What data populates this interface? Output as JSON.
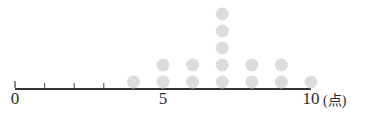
{
  "chart_data": {
    "type": "scatter",
    "plot_kind": "dot-plot",
    "title": "",
    "subtitle": "",
    "xlabel": "(点)",
    "ylabel": "",
    "xlim": [
      0,
      10
    ],
    "grid": false,
    "legend": null,
    "axis_labels": [
      "0",
      "5",
      "10"
    ],
    "axis_label_positions": [
      0,
      5,
      10
    ],
    "tick_positions": [
      0,
      1,
      2,
      3,
      4,
      5,
      6,
      7,
      8,
      9,
      10
    ],
    "categories": [
      0,
      1,
      2,
      3,
      4,
      5,
      6,
      7,
      8,
      9,
      10
    ],
    "values": [
      0,
      0,
      0,
      0,
      1,
      2,
      2,
      5,
      2,
      2,
      1
    ],
    "total_count": 15,
    "dots": [
      {
        "x": 4,
        "count": 1
      },
      {
        "x": 5,
        "count": 2
      },
      {
        "x": 6,
        "count": 2
      },
      {
        "x": 7,
        "count": 5
      },
      {
        "x": 8,
        "count": 2
      },
      {
        "x": 9,
        "count": 2
      },
      {
        "x": 10,
        "count": 1
      }
    ],
    "colors": {
      "dot": "#dcdcdc",
      "axis": "#333333",
      "tick": "#555555",
      "text": "#2b2b2b",
      "background": "#ffffff"
    },
    "geometry": {
      "axis_y": 89,
      "axis_x_start": 15,
      "axis_x_end": 311,
      "unit_px": 29.6,
      "dot_radius": 6.5,
      "row_height": 17,
      "first_row_cy": 82,
      "tick_length": 6
    }
  },
  "labels": {
    "zero": "0",
    "five": "5",
    "ten": "10",
    "unit": "(点)"
  }
}
